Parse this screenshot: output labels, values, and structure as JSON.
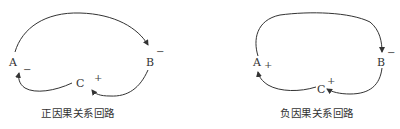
{
  "diagrams": [
    {
      "caption": "正因果关系回路",
      "nodes": {
        "A": {
          "label": "A",
          "sign": "−"
        },
        "B": {
          "label": "B",
          "sign": "−"
        },
        "C": {
          "label": "C",
          "sign": "+"
        }
      },
      "links": [
        {
          "from": "A",
          "to": "B"
        },
        {
          "from": "B",
          "to": "C"
        },
        {
          "from": "C",
          "to": "A"
        }
      ]
    },
    {
      "caption": "负因果关系回路",
      "nodes": {
        "A": {
          "label": "A",
          "sign": "+"
        },
        "B": {
          "label": "B",
          "sign": "−"
        },
        "C": {
          "label": "C",
          "sign": "+"
        }
      },
      "links": [
        {
          "from": "A",
          "to": "B"
        },
        {
          "from": "B",
          "to": "C"
        },
        {
          "from": "C",
          "to": "A"
        }
      ]
    }
  ],
  "colors": {
    "stroke": "#333333",
    "background": "#ffffff"
  }
}
